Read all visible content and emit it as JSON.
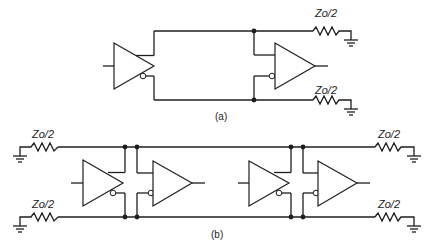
{
  "diagram": {
    "part_a": {
      "caption": "(a)",
      "resistor_top_label": "Zo/2",
      "resistor_bottom_label": "Zo/2",
      "components": [
        "differential driver",
        "differential receiver",
        "two Zo/2 terminating resistors to ground"
      ]
    },
    "part_b": {
      "caption": "(b)",
      "resistor_left_top_label": "Zo/2",
      "resistor_left_bottom_label": "Zo/2",
      "resistor_right_top_label": "Zo/2",
      "resistor_right_bottom_label": "Zo/2",
      "components": [
        "two differential driver/receiver pairs on shared bus",
        "four Zo/2 terminating resistors to ground at both bus ends"
      ]
    },
    "colors": {
      "line": "#1e1e1e",
      "background": "#ffffff"
    }
  }
}
